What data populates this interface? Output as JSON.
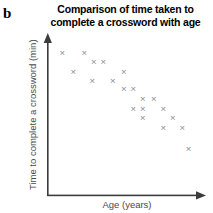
{
  "figure": {
    "panel_letter": "b",
    "background_color": "#ffffff",
    "marker_color": "#8a8a8e",
    "axis_color": "#3c3c3c",
    "label_color": "#4a4a4a",
    "title_color": "#000000"
  },
  "chart_data": {
    "type": "scatter",
    "title": "Comparison of time taken to complete a crossword with age",
    "title_lines": [
      "Comparison of time taken to",
      "complete a crossword with age"
    ],
    "xlabel": "Age (years)",
    "ylabel": "Time to complete a crossword (min)",
    "grid": false,
    "legend": false,
    "xticks": [],
    "yticks": [],
    "xlim": [
      0,
      100
    ],
    "ylim": [
      0,
      100
    ],
    "marker": "x",
    "n_points": 20,
    "correlation": "negative",
    "x": [
      9,
      23,
      29,
      35,
      16,
      28,
      41,
      48,
      54,
      48,
      60,
      67,
      54,
      60,
      73,
      79,
      60,
      73,
      85,
      89
    ],
    "y": [
      90,
      90,
      84,
      84,
      78,
      72,
      72,
      78,
      67,
      67,
      61,
      61,
      55,
      55,
      55,
      49,
      49,
      43,
      43,
      30
    ],
    "points": [
      {
        "x": 9,
        "y": 90
      },
      {
        "x": 23,
        "y": 90
      },
      {
        "x": 29,
        "y": 84
      },
      {
        "x": 35,
        "y": 84
      },
      {
        "x": 16,
        "y": 78
      },
      {
        "x": 28,
        "y": 72
      },
      {
        "x": 41,
        "y": 72
      },
      {
        "x": 48,
        "y": 78
      },
      {
        "x": 54,
        "y": 67
      },
      {
        "x": 48,
        "y": 67
      },
      {
        "x": 60,
        "y": 61
      },
      {
        "x": 67,
        "y": 61
      },
      {
        "x": 54,
        "y": 55
      },
      {
        "x": 60,
        "y": 55
      },
      {
        "x": 73,
        "y": 55
      },
      {
        "x": 79,
        "y": 49
      },
      {
        "x": 60,
        "y": 49
      },
      {
        "x": 73,
        "y": 43
      },
      {
        "x": 85,
        "y": 43
      },
      {
        "x": 89,
        "y": 30
      }
    ]
  }
}
